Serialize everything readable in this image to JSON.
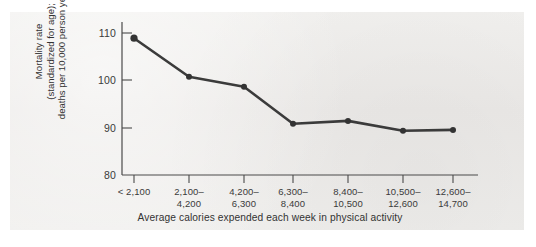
{
  "chart_data": {
    "type": "line",
    "title": "",
    "xlabel": "Average calories expended each week in physical activity",
    "ylabel_lines": [
      "Mortality rate",
      "(standardized for age);",
      "deaths per 10,000 person years"
    ],
    "ylabel": "Mortality rate (standardized for age); deaths per 10,000 person years",
    "categories": [
      "< 2,100",
      "2,100–\n4,200",
      "4,200–\n6,300",
      "6,300–\n8,400",
      "8,400–\n10,500",
      "10,500–\n12,600",
      "12,600–\n14,700"
    ],
    "category_lines": [
      [
        "< 2,100",
        ""
      ],
      [
        "2,100–",
        "4,200"
      ],
      [
        "4,200–",
        "6,300"
      ],
      [
        "6,300–",
        "8,400"
      ],
      [
        "8,400–",
        "10,500"
      ],
      [
        "10,500–",
        "12,600"
      ],
      [
        "12,600–",
        "14,700"
      ]
    ],
    "values": [
      108.9,
      100.8,
      98.7,
      90.9,
      91.5,
      89.4,
      89.6
    ],
    "ylim": [
      80,
      113
    ],
    "yticks": [
      110,
      100,
      90,
      80
    ],
    "ytick_labels": [
      "110",
      "100",
      "90",
      "80"
    ],
    "grid": false,
    "legend": "none",
    "series_color": "#333333",
    "axis_color": "#4a4a4a",
    "background_color": "#efeeec"
  }
}
